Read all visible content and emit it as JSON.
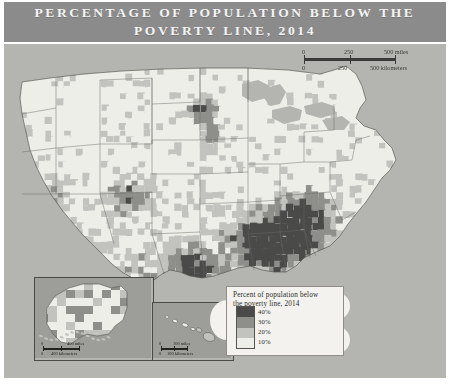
{
  "title": {
    "line1": "PERCENTAGE OF POPULATION BELOW THE",
    "line2": "POVERTY LINE, 2014",
    "banner_color": "#8b8b8b",
    "text_color": "#f4f4f2"
  },
  "main_scale": {
    "miles": {
      "ticks": [
        "0",
        "250",
        "500"
      ],
      "unit": "500 miles"
    },
    "kilometers": {
      "ticks": [
        "0",
        "250",
        "500"
      ],
      "unit": "500 kilometers"
    },
    "miles_zero": "0",
    "miles_mid": "250",
    "miles_end": "500 miles",
    "km_zero": "0",
    "km_mid": "250",
    "km_end": "500 kilometers"
  },
  "legend": {
    "title_line1": "Percent of population below",
    "title_line2": "the poverty line, 2014",
    "entries": [
      {
        "label": "40%",
        "color": "#4a4a48"
      },
      {
        "label": "30%",
        "color": "#8e8e8a"
      },
      {
        "label": "20%",
        "color": "#c2c2be"
      },
      {
        "label": "10%",
        "color": "#eeeee9"
      }
    ],
    "background": "#f3f2ee"
  },
  "insets": {
    "alaska": {
      "name": "Alaska",
      "scale": {
        "miles_zero": "0",
        "miles_end": "400 miles",
        "km_zero": "0",
        "km_end": "400 kilometers"
      }
    },
    "hawaii": {
      "name": "Hawaii",
      "scale": {
        "miles_zero": "0",
        "miles_end": "100 miles",
        "km_zero": "0",
        "km_end": "100 kilometers"
      }
    }
  },
  "map_data": {
    "type": "choropleth",
    "subject": "United States counties",
    "variable": "Percent of population below the poverty line",
    "year": "2014",
    "classes": [
      "10%",
      "20%",
      "30%",
      "40%"
    ],
    "palette": [
      "#eeeee9",
      "#c2c2be",
      "#8e8e8a",
      "#4a4a48"
    ],
    "ocean_color": "#b4b4b1",
    "land_base_color": "#e9e9e4",
    "border_color": "#6a6a66"
  }
}
